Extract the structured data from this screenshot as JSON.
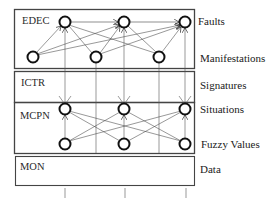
{
  "diagram": {
    "layers": [
      {
        "id": "edec",
        "label": "EDEC"
      },
      {
        "id": "ictr",
        "label": "ICTR"
      },
      {
        "id": "mcpn",
        "label": "MCPN"
      },
      {
        "id": "mon",
        "label": "MON"
      }
    ],
    "side_labels": [
      {
        "id": "faults",
        "label": "Faults"
      },
      {
        "id": "manifestations",
        "label": "Manifestations"
      },
      {
        "id": "signatures",
        "label": "Signatures"
      },
      {
        "id": "situations",
        "label": "Situations"
      },
      {
        "id": "fuzzy_values",
        "label": "Fuzzy Values"
      },
      {
        "id": "data",
        "label": "Data"
      }
    ],
    "nodes": {
      "faults": 3,
      "manifestations": 3,
      "situations": 3,
      "fuzzy_values": 3
    },
    "colors": {
      "stroke": "#1a1a1a",
      "box_stroke": "#444444",
      "background": "#ffffff"
    }
  }
}
